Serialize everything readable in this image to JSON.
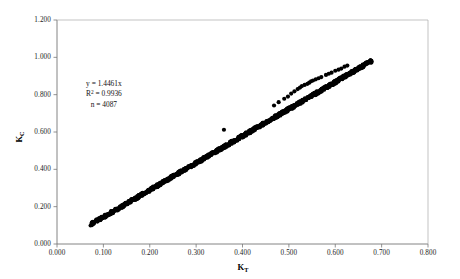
{
  "chart_data": {
    "type": "scatter",
    "title": "",
    "xlabel": "K_T",
    "xlabel_base": "K",
    "xlabel_sub": "T",
    "ylabel": "K_C",
    "ylabel_base": "K",
    "ylabel_sub": "C",
    "xlim": [
      0.0,
      0.8
    ],
    "ylim": [
      0.0,
      1.2
    ],
    "xticks": [
      "0.000",
      "0.100",
      "0.200",
      "0.300",
      "0.400",
      "0.500",
      "0.600",
      "0.700",
      "0.800"
    ],
    "xtick_values": [
      0.0,
      0.1,
      0.2,
      0.3,
      0.4,
      0.5,
      0.6,
      0.7,
      0.8
    ],
    "yticks": [
      "0.000",
      "0.200",
      "0.400",
      "0.600",
      "0.800",
      "1.000",
      "1.200"
    ],
    "ytick_values": [
      0.0,
      0.2,
      0.4,
      0.6,
      0.8,
      1.0,
      1.2
    ],
    "grid": false,
    "legend": "none",
    "marker_color": "#000000",
    "marker_size": 2.1,
    "axis_color": "#808080",
    "annotations": {
      "equation": "y = 1.4461x",
      "r_squared_label": "R",
      "r_squared_sup": "2",
      "r_squared_value": "= 0.9936",
      "n_label": "n = 4087"
    },
    "fit": {
      "slope": 1.4461,
      "intercept": 0.0,
      "r2": 0.9936,
      "n": 4087
    },
    "series": [
      {
        "name": "main band",
        "description": "Dense near-linear cloud following y = 1.4461x from KT=0.075 to KT=0.68",
        "points": [
          [
            0.075,
            0.112
          ],
          [
            0.078,
            0.115
          ],
          [
            0.082,
            0.12
          ],
          [
            0.086,
            0.125
          ],
          [
            0.09,
            0.131
          ],
          [
            0.094,
            0.137
          ],
          [
            0.098,
            0.143
          ],
          [
            0.102,
            0.148
          ],
          [
            0.106,
            0.154
          ],
          [
            0.11,
            0.16
          ],
          [
            0.114,
            0.166
          ],
          [
            0.118,
            0.171
          ],
          [
            0.122,
            0.177
          ],
          [
            0.126,
            0.183
          ],
          [
            0.13,
            0.189
          ],
          [
            0.134,
            0.194
          ],
          [
            0.138,
            0.2
          ],
          [
            0.142,
            0.206
          ],
          [
            0.146,
            0.212
          ],
          [
            0.15,
            0.217
          ],
          [
            0.154,
            0.223
          ],
          [
            0.158,
            0.229
          ],
          [
            0.162,
            0.235
          ],
          [
            0.166,
            0.24
          ],
          [
            0.17,
            0.246
          ],
          [
            0.174,
            0.252
          ],
          [
            0.178,
            0.258
          ],
          [
            0.182,
            0.263
          ],
          [
            0.186,
            0.269
          ],
          [
            0.19,
            0.275
          ],
          [
            0.194,
            0.281
          ],
          [
            0.198,
            0.286
          ],
          [
            0.202,
            0.292
          ],
          [
            0.206,
            0.298
          ],
          [
            0.21,
            0.304
          ],
          [
            0.214,
            0.309
          ],
          [
            0.218,
            0.315
          ],
          [
            0.222,
            0.321
          ],
          [
            0.226,
            0.327
          ],
          [
            0.23,
            0.333
          ],
          [
            0.234,
            0.338
          ],
          [
            0.238,
            0.344
          ],
          [
            0.242,
            0.35
          ],
          [
            0.246,
            0.356
          ],
          [
            0.25,
            0.362
          ],
          [
            0.254,
            0.367
          ],
          [
            0.258,
            0.373
          ],
          [
            0.262,
            0.379
          ],
          [
            0.266,
            0.385
          ],
          [
            0.27,
            0.391
          ],
          [
            0.274,
            0.396
          ],
          [
            0.278,
            0.402
          ],
          [
            0.282,
            0.408
          ],
          [
            0.286,
            0.414
          ],
          [
            0.29,
            0.42
          ],
          [
            0.294,
            0.425
          ],
          [
            0.298,
            0.431
          ],
          [
            0.302,
            0.437
          ],
          [
            0.306,
            0.443
          ],
          [
            0.31,
            0.449
          ],
          [
            0.314,
            0.454
          ],
          [
            0.318,
            0.46
          ],
          [
            0.322,
            0.466
          ],
          [
            0.326,
            0.472
          ],
          [
            0.33,
            0.477
          ],
          [
            0.334,
            0.483
          ],
          [
            0.338,
            0.489
          ],
          [
            0.342,
            0.495
          ],
          [
            0.346,
            0.501
          ],
          [
            0.35,
            0.506
          ],
          [
            0.354,
            0.512
          ],
          [
            0.358,
            0.518
          ],
          [
            0.362,
            0.524
          ],
          [
            0.366,
            0.53
          ],
          [
            0.37,
            0.535
          ],
          [
            0.374,
            0.541
          ],
          [
            0.378,
            0.547
          ],
          [
            0.382,
            0.553
          ],
          [
            0.386,
            0.558
          ],
          [
            0.39,
            0.564
          ],
          [
            0.394,
            0.57
          ],
          [
            0.398,
            0.576
          ],
          [
            0.402,
            0.582
          ],
          [
            0.406,
            0.587
          ],
          [
            0.41,
            0.593
          ],
          [
            0.414,
            0.599
          ],
          [
            0.418,
            0.605
          ],
          [
            0.422,
            0.611
          ],
          [
            0.426,
            0.616
          ],
          [
            0.43,
            0.622
          ],
          [
            0.434,
            0.628
          ],
          [
            0.438,
            0.634
          ],
          [
            0.442,
            0.639
          ],
          [
            0.446,
            0.645
          ],
          [
            0.45,
            0.651
          ],
          [
            0.454,
            0.657
          ],
          [
            0.458,
            0.663
          ],
          [
            0.462,
            0.668
          ],
          [
            0.466,
            0.674
          ],
          [
            0.47,
            0.68
          ],
          [
            0.474,
            0.686
          ],
          [
            0.478,
            0.692
          ],
          [
            0.482,
            0.697
          ],
          [
            0.486,
            0.703
          ],
          [
            0.49,
            0.709
          ],
          [
            0.494,
            0.715
          ],
          [
            0.498,
            0.72
          ],
          [
            0.502,
            0.726
          ],
          [
            0.506,
            0.732
          ],
          [
            0.51,
            0.738
          ],
          [
            0.514,
            0.744
          ],
          [
            0.518,
            0.749
          ],
          [
            0.522,
            0.755
          ],
          [
            0.526,
            0.761
          ],
          [
            0.53,
            0.767
          ],
          [
            0.534,
            0.773
          ],
          [
            0.538,
            0.778
          ],
          [
            0.542,
            0.784
          ],
          [
            0.546,
            0.79
          ],
          [
            0.55,
            0.796
          ],
          [
            0.554,
            0.801
          ],
          [
            0.558,
            0.807
          ],
          [
            0.562,
            0.813
          ],
          [
            0.566,
            0.819
          ],
          [
            0.57,
            0.825
          ],
          [
            0.574,
            0.83
          ],
          [
            0.578,
            0.836
          ],
          [
            0.582,
            0.842
          ],
          [
            0.586,
            0.848
          ],
          [
            0.59,
            0.854
          ],
          [
            0.594,
            0.859
          ],
          [
            0.598,
            0.865
          ],
          [
            0.602,
            0.871
          ],
          [
            0.606,
            0.877
          ],
          [
            0.61,
            0.882
          ],
          [
            0.614,
            0.888
          ],
          [
            0.618,
            0.894
          ],
          [
            0.622,
            0.9
          ],
          [
            0.626,
            0.906
          ],
          [
            0.63,
            0.911
          ],
          [
            0.634,
            0.917
          ],
          [
            0.638,
            0.923
          ],
          [
            0.642,
            0.929
          ],
          [
            0.646,
            0.935
          ],
          [
            0.65,
            0.94
          ],
          [
            0.654,
            0.946
          ],
          [
            0.658,
            0.952
          ],
          [
            0.662,
            0.958
          ],
          [
            0.666,
            0.963
          ],
          [
            0.67,
            0.969
          ],
          [
            0.674,
            0.975
          ],
          [
            0.678,
            0.981
          ]
        ]
      },
      {
        "name": "upper outliers",
        "description": "Sparse points lying above the main band between KT=0.35 and KT=0.63",
        "points": [
          [
            0.36,
            0.612
          ],
          [
            0.468,
            0.742
          ],
          [
            0.478,
            0.76
          ],
          [
            0.505,
            0.806
          ],
          [
            0.512,
            0.818
          ],
          [
            0.528,
            0.846
          ],
          [
            0.534,
            0.852
          ],
          [
            0.54,
            0.858
          ],
          [
            0.552,
            0.876
          ],
          [
            0.558,
            0.882
          ],
          [
            0.564,
            0.888
          ],
          [
            0.57,
            0.894
          ],
          [
            0.58,
            0.906
          ],
          [
            0.586,
            0.912
          ],
          [
            0.592,
            0.918
          ],
          [
            0.6,
            0.928
          ],
          [
            0.607,
            0.934
          ],
          [
            0.613,
            0.94
          ],
          [
            0.62,
            0.95
          ],
          [
            0.626,
            0.956
          ],
          [
            0.548,
            0.872
          ],
          [
            0.544,
            0.864
          ],
          [
            0.49,
            0.778
          ],
          [
            0.498,
            0.79
          ],
          [
            0.519,
            0.83
          ],
          [
            0.524,
            0.838
          ]
        ]
      }
    ]
  }
}
